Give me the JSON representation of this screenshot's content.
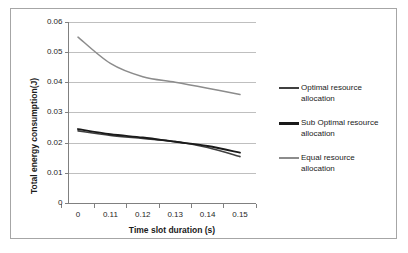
{
  "chart_data": {
    "type": "line",
    "title": "",
    "xlabel": "Time slot duration (s)",
    "ylabel": "Total energy consumption(J)",
    "x": [
      0,
      0.11,
      0.12,
      0.13,
      0.14,
      0.15
    ],
    "xtick_labels": [
      "0",
      "0.11",
      "0.12",
      "0.13",
      "0.14",
      "0.15"
    ],
    "ytick_labels": [
      "0",
      "0.01",
      "0.02",
      "0.03",
      "0.04",
      "0.05",
      "0.06"
    ],
    "ylim": [
      0,
      0.06
    ],
    "ystep": 0.01,
    "grid": "horizontal",
    "legend_position": "right",
    "series": [
      {
        "name": "Optimal resource allocation",
        "color": "#404040",
        "width": 1.6,
        "values": [
          0.024,
          0.0225,
          0.0215,
          0.0205,
          0.0185,
          0.0155
        ]
      },
      {
        "name": "Sub Optimal  resource allocation",
        "color": "#1a1a1a",
        "width": 1.9,
        "values": [
          0.0246,
          0.0229,
          0.0218,
          0.0204,
          0.019,
          0.0168
        ]
      },
      {
        "name": "Equal resource allocation",
        "color": "#8c8c8c",
        "width": 1.5,
        "values": [
          0.055,
          0.0463,
          0.0419,
          0.0401,
          0.0381,
          0.036
        ]
      }
    ]
  },
  "legend": {
    "items": [
      {
        "label": "Optimal resource\nallocation",
        "color": "#404040",
        "thickness": "2px"
      },
      {
        "label": "Sub Optimal  resource\nallocation",
        "color": "#1a1a1a",
        "thickness": "3px"
      },
      {
        "label": "Equal resource\nallocation",
        "color": "#8c8c8c",
        "thickness": "1.5px"
      }
    ]
  },
  "axes": {
    "y_title": "Total energy consumption(J)",
    "x_title": "Time slot duration (s)",
    "yticks": [
      "0.06",
      "0.05",
      "0.04",
      "0.03",
      "0.02",
      "0.01",
      "0"
    ],
    "xticks": [
      "0",
      "0.11",
      "0.12",
      "0.13",
      "0.14",
      "0.15"
    ]
  },
  "colors": {
    "frame": "#a6a6a6",
    "grid": "#bfbfbf",
    "axis": "#808080",
    "text": "#1a1a1a"
  }
}
